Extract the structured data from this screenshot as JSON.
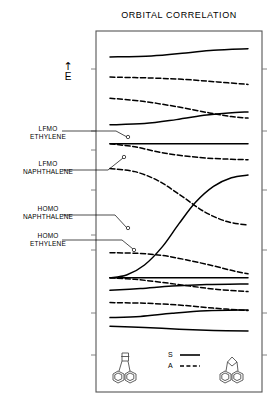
{
  "figure": {
    "title": "ORBITAL CORRELATION",
    "energy_axis": {
      "arrow": "↑",
      "letter": "E"
    },
    "frame": {
      "x": 96,
      "y": 31,
      "width": 166,
      "height": 361
    },
    "legend": {
      "symmetric_label": "S",
      "antisymmetric_label": "A",
      "symmetric_style": "solid",
      "antisymmetric_style": "dashed"
    },
    "level_labels": [
      {
        "line1": "LFMO",
        "line2": "ETHYLENE"
      },
      {
        "line1": "LFMO",
        "line2": "NAPHTHALENE"
      },
      {
        "line1": "HOMO",
        "line2": "NAPHTHALENE"
      },
      {
        "line1": "HOMO",
        "line2": "ETHYLENE"
      }
    ],
    "left_structure_name": "naphthalene-ethylene-complex",
    "right_structure_name": "benzobicyclic-adduct"
  },
  "chart_data": {
    "type": "line",
    "title": "ORBITAL CORRELATION",
    "xlabel": "",
    "ylabel": "E",
    "xlim": [
      0,
      1
    ],
    "ylim": [
      0,
      1
    ],
    "grid": false,
    "legend_position": "bottom-center",
    "x_axis_note": "reaction coordinate from reactant (left) to product (right)",
    "series": [
      {
        "name": "level-1-top-symmetric",
        "symmetry": "S",
        "style": "solid",
        "points": [
          [
            0.0,
            0.935
          ],
          [
            0.3,
            0.938
          ],
          [
            0.55,
            0.948
          ],
          [
            0.75,
            0.957
          ],
          [
            1.0,
            0.962
          ]
        ]
      },
      {
        "name": "level-2-antisymmetric",
        "symmetry": "A",
        "style": "dashed",
        "points": [
          [
            0.0,
            0.869
          ],
          [
            0.3,
            0.866
          ],
          [
            0.55,
            0.861
          ],
          [
            0.78,
            0.853
          ],
          [
            1.0,
            0.845
          ]
        ]
      },
      {
        "name": "level-3-antisymmetric",
        "symmetry": "A",
        "style": "dashed",
        "points": [
          [
            0.0,
            0.8
          ],
          [
            0.25,
            0.789
          ],
          [
            0.5,
            0.771
          ],
          [
            0.72,
            0.752
          ],
          [
            0.88,
            0.74
          ],
          [
            1.0,
            0.735
          ]
        ]
      },
      {
        "name": "level-4-symmetric",
        "symmetry": "S",
        "style": "solid",
        "points": [
          [
            0.0,
            0.713
          ],
          [
            0.25,
            0.717
          ],
          [
            0.48,
            0.73
          ],
          [
            0.7,
            0.745
          ],
          [
            0.86,
            0.752
          ],
          [
            1.0,
            0.755
          ]
        ]
      },
      {
        "name": "lfmo-ethylene-symmetric",
        "symmetry": "S",
        "style": "solid",
        "label": "LFMO ETHYLENE",
        "points": [
          [
            0.0,
            0.651
          ],
          [
            0.3,
            0.651
          ],
          [
            0.6,
            0.651
          ],
          [
            1.0,
            0.651
          ]
        ]
      },
      {
        "name": "lfmo-ethylene-antisymmetric",
        "symmetry": "A",
        "style": "dashed",
        "points": [
          [
            0.0,
            0.651
          ],
          [
            0.18,
            0.641
          ],
          [
            0.4,
            0.62
          ],
          [
            0.65,
            0.606
          ],
          [
            0.85,
            0.601
          ],
          [
            1.0,
            0.599
          ]
        ]
      },
      {
        "name": "lfmo-naphthalene-antisymmetric",
        "symmetry": "A",
        "style": "dashed",
        "label": "LFMO NAPHTHALENE",
        "points": [
          [
            0.0,
            0.57
          ],
          [
            0.18,
            0.56
          ],
          [
            0.35,
            0.53
          ],
          [
            0.52,
            0.48
          ],
          [
            0.68,
            0.43
          ],
          [
            0.84,
            0.398
          ],
          [
            1.0,
            0.385
          ]
        ]
      },
      {
        "name": "correlating-symmetric-rising",
        "symmetry": "S",
        "style": "solid",
        "points": [
          [
            0.0,
            0.213
          ],
          [
            0.12,
            0.222
          ],
          [
            0.25,
            0.255
          ],
          [
            0.38,
            0.315
          ],
          [
            0.5,
            0.39
          ],
          [
            0.62,
            0.46
          ],
          [
            0.75,
            0.512
          ],
          [
            0.88,
            0.54
          ],
          [
            1.0,
            0.549
          ]
        ]
      },
      {
        "name": "homo-naphthalene-antisymmetric",
        "symmetry": "A",
        "style": "dashed",
        "label": "HOMO NAPHTHALENE",
        "points": [
          [
            0.0,
            0.295
          ],
          [
            0.2,
            0.293
          ],
          [
            0.38,
            0.286
          ],
          [
            0.55,
            0.272
          ],
          [
            0.75,
            0.252
          ],
          [
            0.9,
            0.235
          ],
          [
            1.0,
            0.226
          ]
        ]
      },
      {
        "name": "homo-ethylene-symmetric",
        "symmetry": "S",
        "style": "solid",
        "label": "HOMO ETHYLENE",
        "points": [
          [
            0.0,
            0.213
          ],
          [
            0.3,
            0.213
          ],
          [
            0.6,
            0.213
          ],
          [
            1.0,
            0.213
          ]
        ]
      },
      {
        "name": "homo-ethylene-antisymmetric-down",
        "symmetry": "A",
        "style": "dashed",
        "points": [
          [
            0.0,
            0.213
          ],
          [
            0.18,
            0.208
          ],
          [
            0.38,
            0.198
          ],
          [
            0.58,
            0.186
          ],
          [
            0.78,
            0.175
          ],
          [
            1.0,
            0.168
          ]
        ]
      },
      {
        "name": "level-lower-1-symmetric",
        "symmetry": "S",
        "style": "solid",
        "points": [
          [
            0.0,
            0.172
          ],
          [
            0.22,
            0.178
          ],
          [
            0.45,
            0.186
          ],
          [
            0.7,
            0.191
          ],
          [
            1.0,
            0.193
          ]
        ]
      },
      {
        "name": "level-lower-2-antisymmetric",
        "symmetry": "A",
        "style": "dashed",
        "points": [
          [
            0.0,
            0.132
          ],
          [
            0.25,
            0.13
          ],
          [
            0.5,
            0.124
          ],
          [
            0.75,
            0.114
          ],
          [
            1.0,
            0.106
          ]
        ]
      },
      {
        "name": "level-lower-3-symmetric",
        "symmetry": "S",
        "style": "solid",
        "points": [
          [
            0.0,
            0.083
          ],
          [
            0.22,
            0.087
          ],
          [
            0.45,
            0.097
          ],
          [
            0.7,
            0.105
          ],
          [
            1.0,
            0.108
          ]
        ]
      },
      {
        "name": "level-lower-4-symmetric",
        "symmetry": "S",
        "style": "solid",
        "points": [
          [
            0.0,
            0.055
          ],
          [
            0.25,
            0.051
          ],
          [
            0.5,
            0.045
          ],
          [
            0.75,
            0.041
          ],
          [
            1.0,
            0.039
          ]
        ]
      }
    ]
  }
}
